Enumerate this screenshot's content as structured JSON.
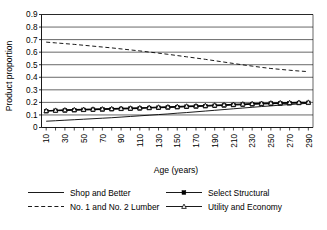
{
  "chart_data": {
    "type": "line",
    "title": "",
    "xlabel": "Age (years)",
    "ylabel": "Product proportion",
    "xlim": [
      5,
      295
    ],
    "ylim": [
      0,
      0.9
    ],
    "grid": "horizontal",
    "legend_position": "bottom",
    "ytick_labels": [
      "0.9",
      "0.8",
      "0.7",
      "0.6",
      "0.5",
      "0.4",
      "0.3",
      "0.2",
      "0.1",
      "0"
    ],
    "ytick_values": [
      0.9,
      0.8,
      0.7,
      0.6,
      0.5,
      0.4,
      0.3,
      0.2,
      0.1,
      0
    ],
    "xtick_labels": [
      "10",
      "30",
      "50",
      "70",
      "90",
      "110",
      "130",
      "150",
      "170",
      "190",
      "210",
      "230",
      "250",
      "270",
      "290"
    ],
    "xtick_values": [
      10,
      30,
      50,
      70,
      90,
      110,
      130,
      150,
      170,
      190,
      210,
      230,
      250,
      270,
      290
    ],
    "x": [
      10,
      20,
      30,
      40,
      50,
      60,
      70,
      80,
      90,
      100,
      110,
      120,
      130,
      140,
      150,
      160,
      170,
      180,
      190,
      200,
      210,
      220,
      230,
      240,
      250,
      260,
      270,
      280,
      290
    ],
    "series": [
      {
        "name": "Shop and Better",
        "style": "solid",
        "marker": "none",
        "color": "#000000",
        "values": [
          0.05,
          0.054,
          0.058,
          0.062,
          0.066,
          0.07,
          0.074,
          0.078,
          0.083,
          0.088,
          0.093,
          0.098,
          0.103,
          0.108,
          0.114,
          0.119,
          0.125,
          0.131,
          0.137,
          0.143,
          0.149,
          0.155,
          0.161,
          0.167,
          0.172,
          0.178,
          0.183,
          0.188,
          0.193
        ]
      },
      {
        "name": "Select Structural",
        "style": "solid",
        "marker": "square",
        "color": "#000000",
        "values": [
          0.13,
          0.133,
          0.136,
          0.138,
          0.14,
          0.142,
          0.144,
          0.146,
          0.148,
          0.15,
          0.152,
          0.155,
          0.157,
          0.16,
          0.162,
          0.165,
          0.168,
          0.17,
          0.173,
          0.176,
          0.179,
          0.182,
          0.185,
          0.188,
          0.19,
          0.192,
          0.193,
          0.195,
          0.196
        ]
      },
      {
        "name": "No. 1 and No. 2 Lumber",
        "style": "dashed",
        "marker": "none",
        "color": "#000000",
        "values": [
          0.68,
          0.674,
          0.668,
          0.662,
          0.655,
          0.648,
          0.641,
          0.634,
          0.626,
          0.618,
          0.61,
          0.601,
          0.592,
          0.583,
          0.573,
          0.563,
          0.553,
          0.543,
          0.532,
          0.521,
          0.51,
          0.499,
          0.489,
          0.479,
          0.47,
          0.463,
          0.456,
          0.45,
          0.445
        ]
      },
      {
        "name": "Utility and Economy",
        "style": "solid",
        "marker": "triangle",
        "color": "#000000",
        "values": [
          0.134,
          0.137,
          0.14,
          0.142,
          0.144,
          0.146,
          0.148,
          0.15,
          0.152,
          0.154,
          0.157,
          0.159,
          0.162,
          0.164,
          0.167,
          0.17,
          0.172,
          0.175,
          0.178,
          0.181,
          0.184,
          0.187,
          0.19,
          0.192,
          0.195,
          0.197,
          0.198,
          0.2,
          0.201
        ]
      }
    ],
    "legend": [
      {
        "label": "Shop and Better",
        "style": "solid",
        "marker": "none"
      },
      {
        "label": "Select Structural",
        "style": "solid",
        "marker": "square"
      },
      {
        "label": "No. 1 and No. 2 Lumber",
        "style": "dashed",
        "marker": "none"
      },
      {
        "label": "Utility and Economy",
        "style": "solid",
        "marker": "triangle"
      }
    ]
  }
}
